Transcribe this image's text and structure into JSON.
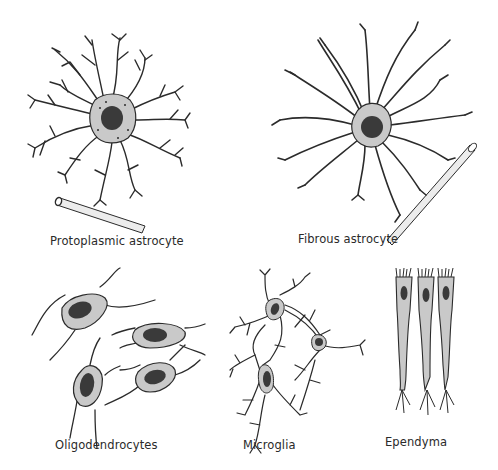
{
  "figure": {
    "colors": {
      "outline": "#2b2b2b",
      "cytoplasm": "#c9c9c9",
      "nucleus": "#3a3a3a",
      "vessel_fill": "#ececec",
      "background": "#ffffff"
    },
    "panels": [
      {
        "id": "protoplasmic-astrocyte",
        "label": "Protoplasmic astrocyte",
        "has_blood_vessel": true
      },
      {
        "id": "fibrous-astrocyte",
        "label": "Fibrous astrocyte",
        "has_blood_vessel": true
      },
      {
        "id": "oligodendrocytes",
        "label": "Oligodendrocytes",
        "cell_count": 4
      },
      {
        "id": "microglia",
        "label": "Microglia",
        "cell_count": 3
      },
      {
        "id": "ependyma",
        "label": "Ependyma",
        "cell_count": 3
      }
    ]
  }
}
